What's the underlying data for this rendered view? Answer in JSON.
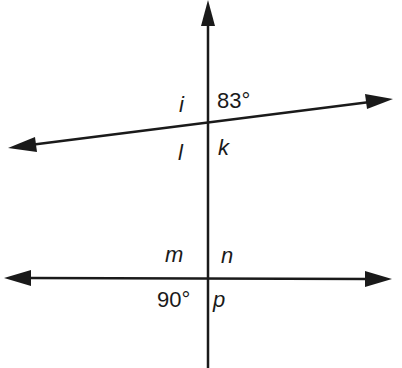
{
  "diagram": {
    "type": "transversal-angles",
    "lines": {
      "transversal": {
        "orientation": "vertical",
        "arrow": "up"
      },
      "line_top": {
        "orientation": "slanted",
        "arrows": "both"
      },
      "line_bottom": {
        "orientation": "horizontal",
        "arrows": "both"
      }
    },
    "labels": {
      "top_left": "i",
      "top_right": "83°",
      "top_bottom_left": "l",
      "top_bottom_right": "k",
      "bottom_top_left": "m",
      "bottom_top_right": "n",
      "bottom_bottom_left": "90°",
      "bottom_bottom_right": "p"
    },
    "colors": {
      "ink": "#1a1a1a",
      "background": "#ffffff"
    }
  }
}
